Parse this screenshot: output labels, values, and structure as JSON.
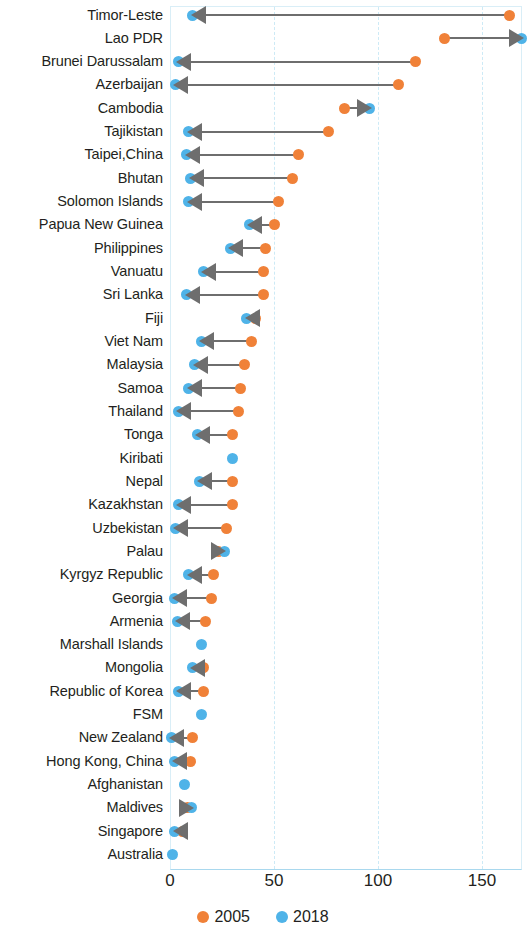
{
  "chart_data": {
    "type": "scatter",
    "title": "",
    "subtitle": "",
    "xlabel": "",
    "ylabel": "",
    "xlim": [
      0,
      172
    ],
    "grid": true,
    "legend_position": "bottom",
    "tick_labels": [
      "0",
      "50",
      "100",
      "150"
    ],
    "ticks": [
      0,
      50,
      100,
      150
    ],
    "legend": [
      {
        "name": "2005",
        "color": "#f08138"
      },
      {
        "name": "2018",
        "color": "#4fb3e8"
      }
    ],
    "series": [
      {
        "name": "2005",
        "color": "#f08138"
      },
      {
        "name": "2018",
        "color": "#4fb3e8"
      }
    ],
    "categories": [
      "Timor-Leste",
      "Lao PDR",
      "Brunei Darussalam",
      "Azerbaijan",
      "Cambodia",
      "Tajikistan",
      "Taipei,China",
      "Bhutan",
      "Solomon Islands",
      "Papua New Guinea",
      "Philippines",
      "Vanuatu",
      "Sri Lanka",
      "Fiji",
      "Viet Nam",
      "Malaysia",
      "Samoa",
      "Thailand",
      "Tonga",
      "Kiribati",
      "Nepal",
      "Kazakhstan",
      "Uzbekistan",
      "Palau",
      "Kyrgyz Republic",
      "Georgia",
      "Armenia",
      "Marshall Islands",
      "Mongolia",
      "Republic of Korea",
      "FSM",
      "New Zealand",
      "Hong Kong, China",
      "Afghanistan",
      "Maldives",
      "Singapore",
      "Australia"
    ],
    "rows": [
      {
        "label": "Timor-Leste",
        "v2005": 163,
        "v2018": 11
      },
      {
        "label": "Lao PDR",
        "v2005": 132,
        "v2018": 169
      },
      {
        "label": "Brunei Darussalam",
        "v2005": 118,
        "v2018": 4
      },
      {
        "label": "Azerbaijan",
        "v2005": 110,
        "v2018": 2.5
      },
      {
        "label": "Cambodia",
        "v2005": 84,
        "v2018": 96
      },
      {
        "label": "Tajikistan",
        "v2005": 76,
        "v2018": 9
      },
      {
        "label": "Taipei,China",
        "v2005": 62,
        "v2018": 8
      },
      {
        "label": "Bhutan",
        "v2005": 59,
        "v2018": 10
      },
      {
        "label": "Solomon Islands",
        "v2005": 52,
        "v2018": 9
      },
      {
        "label": "Papua New Guinea",
        "v2005": 50,
        "v2018": 38
      },
      {
        "label": "Philippines",
        "v2005": 46,
        "v2018": 29
      },
      {
        "label": "Vanuatu",
        "v2005": 45,
        "v2018": 16
      },
      {
        "label": "Sri Lanka",
        "v2005": 45,
        "v2018": 8
      },
      {
        "label": "Fiji",
        "v2005": 41,
        "v2018": 37
      },
      {
        "label": "Viet Nam",
        "v2005": 39,
        "v2018": 15
      },
      {
        "label": "Malaysia",
        "v2005": 36,
        "v2018": 12
      },
      {
        "label": "Samoa",
        "v2005": 34,
        "v2018": 9
      },
      {
        "label": "Thailand",
        "v2005": 33,
        "v2018": 4
      },
      {
        "label": "Tonga",
        "v2005": 30,
        "v2018": 13
      },
      {
        "label": "Kiribati",
        "v2005": null,
        "v2018": 30
      },
      {
        "label": "Nepal",
        "v2005": 30,
        "v2018": 14
      },
      {
        "label": "Kazakhstan",
        "v2005": 30,
        "v2018": 4
      },
      {
        "label": "Uzbekistan",
        "v2005": 27,
        "v2018": 2.5
      },
      {
        "label": "Palau",
        "v2005": 23.5,
        "v2018": 26
      },
      {
        "label": "Kyrgyz Republic",
        "v2005": 21,
        "v2018": 9
      },
      {
        "label": "Georgia",
        "v2005": 20,
        "v2018": 2
      },
      {
        "label": "Armenia",
        "v2005": 17,
        "v2018": 3.4
      },
      {
        "label": "Marshall Islands",
        "v2005": null,
        "v2018": 15
      },
      {
        "label": "Mongolia",
        "v2005": 16,
        "v2018": 10.6
      },
      {
        "label": "Republic of Korea",
        "v2005": 16,
        "v2018": 4
      },
      {
        "label": "FSM",
        "v2005": null,
        "v2018": 15
      },
      {
        "label": "New Zealand",
        "v2005": 11,
        "v2018": 0.5
      },
      {
        "label": "Hong Kong, China",
        "v2005": 10,
        "v2018": 2
      },
      {
        "label": "Afghanistan",
        "v2005": null,
        "v2018": 7
      },
      {
        "label": "Maldives",
        "v2005": 8.6,
        "v2018": 10.5
      },
      {
        "label": "Singapore",
        "v2005": 5.8,
        "v2018": 2.4
      },
      {
        "label": "Australia",
        "v2005": null,
        "v2018": 1
      }
    ]
  }
}
